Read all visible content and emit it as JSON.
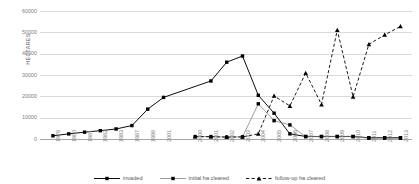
{
  "chart_data": {
    "type": "line",
    "title": "",
    "xlabel": "",
    "ylabel": "HECTARES",
    "ylim": [
      0,
      60000
    ],
    "ytick_values": [
      0,
      10000,
      20000,
      30000,
      40000,
      50000,
      60000
    ],
    "ytick_labels": [
      "0",
      "10000",
      "20000",
      "30000",
      "40000",
      "50000",
      "60000"
    ],
    "grid": "horizontal",
    "legend_position": "bottom-center",
    "categories": [
      "1978",
      "1980",
      "1981",
      "1982",
      "1983",
      "1987",
      "1998",
      "2001",
      "",
      "2000",
      "2001",
      "2002",
      "2003",
      "2004",
      "2005",
      "2006",
      "2007",
      "2008",
      "2009",
      "2010",
      "2011",
      "2012",
      "2013"
    ],
    "series": [
      {
        "name": "invaded",
        "line_style": "solid",
        "marker": "square",
        "color": "#000000",
        "values": [
          1500,
          2400,
          3200,
          3900,
          4700,
          6300,
          14000,
          19500,
          null,
          null,
          27200,
          36000,
          38900,
          20500,
          12100,
          2400,
          1200,
          1200,
          1200,
          1200,
          600,
          600,
          600
        ]
      },
      {
        "name": "initial ha cleared",
        "line_style": "thin-solid",
        "marker": "square",
        "color": "#7f7f7f",
        "values": [
          null,
          null,
          null,
          null,
          null,
          null,
          null,
          null,
          null,
          1100,
          1100,
          900,
          1000,
          16500,
          8600,
          6600,
          1100,
          1100,
          1100,
          1100,
          400,
          400,
          400
        ]
      },
      {
        "name": "follow-up ha cleared",
        "line_style": "dashed",
        "marker": "triangle",
        "color": "#000000",
        "values": [
          null,
          null,
          null,
          null,
          null,
          null,
          null,
          null,
          null,
          1100,
          1100,
          900,
          1000,
          2400,
          20200,
          15500,
          30900,
          16200,
          51100,
          19800,
          44400,
          48800,
          52800
        ]
      }
    ]
  },
  "legend": {
    "items": [
      {
        "label": "invaded"
      },
      {
        "label": "initial ha cleared"
      },
      {
        "label": "follow-up ha cleared"
      }
    ]
  },
  "colors": {
    "gridline": "#d9d9d9",
    "axis": "#a6a6a6",
    "tick_text": "#808080",
    "title_text": "#595959",
    "background": "#ffffff"
  }
}
